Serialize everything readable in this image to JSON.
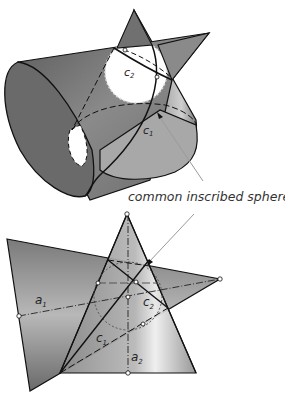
{
  "figure": {
    "top": {
      "labels": {
        "c1": "c",
        "c1_sub": "1",
        "c2": "c",
        "c2_sub": "2"
      }
    },
    "caption": "common inscribed sphere",
    "bottom": {
      "labels": {
        "a1": "a",
        "a1_sub": "1",
        "a2": "a",
        "a2_sub": "2",
        "c1": "c",
        "c1_sub": "1",
        "c2": "c",
        "c2_sub": "2"
      }
    },
    "colors": {
      "surface_dark": "#6e6e6e",
      "surface_mid": "#9a9a9a",
      "surface_light": "#d8d8d8",
      "edge": "#111111",
      "sphere": "#ffffff",
      "arrow": "#9a9a9a"
    }
  }
}
